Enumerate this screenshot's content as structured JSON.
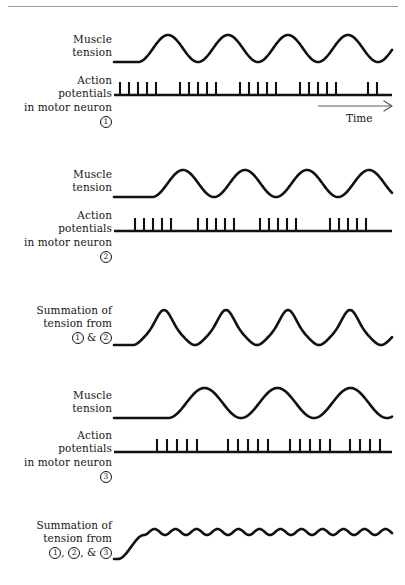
{
  "figure": {
    "title_rule_visible": true,
    "background": "#ffffff",
    "ink_color": "#111111",
    "arrow_color": "#5a5a5a",
    "time_axis": {
      "label": "Time",
      "arrow": "right-arrow-icon",
      "x_start": 318,
      "x_end": 392,
      "y": 106
    }
  },
  "panels": [
    {
      "id": "muscle-tension-1",
      "kind": "tension",
      "label_lines": [
        "Muscle",
        "tension"
      ],
      "label_x": 20,
      "label_y": 33,
      "label_width": 92,
      "baseline_y": 62,
      "plot_x": 114,
      "plot_x_end": 392,
      "flat_until": 138,
      "cycles": 4,
      "amplitude": 27,
      "period": 60,
      "ripple": 0
    },
    {
      "id": "action-potentials-1",
      "kind": "spikes",
      "label_lines": [
        "Action",
        "potentials",
        "in motor neuron"
      ],
      "label_circle": "1",
      "label_x": 8,
      "label_y": 74,
      "label_width": 104,
      "baseline_y": 95,
      "plot_x": 114,
      "plot_x_end": 392,
      "spike_height": 12,
      "bursts": [
        {
          "start": 120,
          "count": 5,
          "gap": 9
        },
        {
          "start": 180,
          "count": 5,
          "gap": 9
        },
        {
          "start": 240,
          "count": 5,
          "gap": 9
        },
        {
          "start": 300,
          "count": 5,
          "gap": 9
        },
        {
          "start": 368,
          "count": 2,
          "gap": 9
        }
      ]
    },
    {
      "id": "muscle-tension-2",
      "kind": "tension",
      "label_lines": [
        "Muscle",
        "tension"
      ],
      "label_x": 20,
      "label_y": 168,
      "label_width": 92,
      "baseline_y": 197,
      "plot_x": 114,
      "plot_x_end": 392,
      "flat_until": 152,
      "cycles": 4,
      "amplitude": 27,
      "period": 62,
      "ripple": 0
    },
    {
      "id": "action-potentials-2",
      "kind": "spikes",
      "label_lines": [
        "Action",
        "potentials",
        "in motor neuron"
      ],
      "label_circle": "2",
      "label_x": 8,
      "label_y": 209,
      "label_width": 104,
      "baseline_y": 231,
      "plot_x": 114,
      "plot_x_end": 392,
      "spike_height": 12,
      "bursts": [
        {
          "start": 135,
          "count": 5,
          "gap": 9
        },
        {
          "start": 198,
          "count": 5,
          "gap": 9
        },
        {
          "start": 260,
          "count": 5,
          "gap": 9
        },
        {
          "start": 330,
          "count": 5,
          "gap": 9
        }
      ]
    },
    {
      "id": "summation-1-2",
      "kind": "tension",
      "label_lines": [
        "Summation of",
        "tension from"
      ],
      "label_circle_pair": [
        "1",
        "2"
      ],
      "label_joiner": " & ",
      "label_x": 8,
      "label_y": 304,
      "label_width": 104,
      "baseline_y": 345,
      "plot_x": 114,
      "plot_x_end": 392,
      "flat_until": 133,
      "cycles": 4,
      "amplitude": 26,
      "period": 62,
      "ripple": 9,
      "ripple_cycles": 2
    },
    {
      "id": "muscle-tension-3",
      "kind": "tension",
      "label_lines": [
        "Muscle",
        "tension"
      ],
      "label_x": 20,
      "label_y": 389,
      "label_width": 92,
      "baseline_y": 418,
      "plot_x": 114,
      "plot_x_end": 392,
      "flat_until": 168,
      "cycles": 3.6,
      "amplitude": 30,
      "period": 73,
      "ripple": 0
    },
    {
      "id": "action-potentials-3",
      "kind": "spikes",
      "label_lines": [
        "Action",
        "potentials",
        "in motor neuron"
      ],
      "label_circle": "3",
      "label_x": 8,
      "label_y": 429,
      "label_width": 104,
      "baseline_y": 452,
      "plot_x": 114,
      "plot_x_end": 392,
      "spike_height": 12,
      "bursts": [
        {
          "start": 157,
          "count": 5,
          "gap": 10
        },
        {
          "start": 228,
          "count": 5,
          "gap": 10
        },
        {
          "start": 290,
          "count": 5,
          "gap": 10
        },
        {
          "start": 350,
          "count": 4,
          "gap": 10
        }
      ]
    },
    {
      "id": "summation-1-2-3",
      "kind": "tension",
      "label_lines": [
        "Summation of",
        "tension from"
      ],
      "label_circle_triple": [
        "1",
        "2",
        "3"
      ],
      "label_joiner_2": ", ",
      "label_joiner_3": ", & ",
      "label_x": 8,
      "label_y": 519,
      "label_width": 104,
      "baseline_y": 559,
      "plot_x": 114,
      "plot_x_end": 392,
      "flat_until": 128,
      "rise_height": 24,
      "cycles": 13,
      "amplitude": 0,
      "period": 21,
      "ripple": 6,
      "ripple_cycles": 13,
      "plateau": true
    }
  ]
}
